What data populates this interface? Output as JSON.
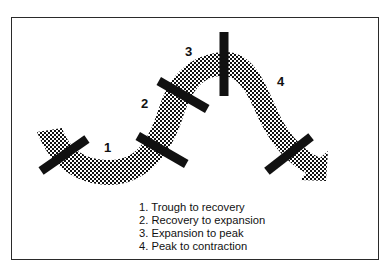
{
  "diagram": {
    "colors": {
      "frame": "#2a2a2a",
      "curve_pattern": "#111111",
      "markers": "#111111",
      "background": "#ffffff"
    },
    "curve": {
      "fill": "checkered-pattern",
      "ends_with": "arrow-head"
    },
    "phase_labels": [
      {
        "num": "1"
      },
      {
        "num": "2"
      },
      {
        "num": "3"
      },
      {
        "num": "4"
      }
    ],
    "legend": {
      "items": [
        {
          "text": "1.  Trough to recovery"
        },
        {
          "text": "2.  Recovery to expansion"
        },
        {
          "text": "3.  Expansion to peak"
        },
        {
          "text": "4.  Peak to contraction"
        }
      ]
    }
  }
}
